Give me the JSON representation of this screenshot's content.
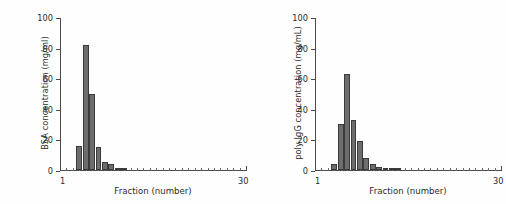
{
  "figure": {
    "background": "#ffffff",
    "bar_color": "#6d6d6d",
    "bar_edge_color": "#3a3a3a",
    "axis_color": "#4a4a4a",
    "text_color": "#2b2b2b"
  },
  "chart_data": [
    {
      "type": "bar",
      "panel": "left",
      "title": "",
      "xlabel": "Fraction (number)",
      "ylabel": "BSA concentration (mg/ml)",
      "xlim": [
        1,
        30
      ],
      "ylim": [
        0,
        100
      ],
      "yticks": [
        0,
        20,
        40,
        60,
        80,
        100
      ],
      "ytick_labels": [
        "0",
        "20",
        "40",
        "60",
        "80",
        "100"
      ],
      "xtick_labels": [
        "1",
        "30"
      ],
      "xtick_label_positions": [
        1,
        30
      ],
      "grid": false,
      "legend": null,
      "categories": [
        1,
        2,
        3,
        4,
        5,
        6,
        7,
        8,
        9,
        10,
        11,
        12,
        13,
        14,
        15,
        16,
        17,
        18,
        19,
        20,
        21,
        22,
        23,
        24,
        25,
        26,
        27,
        28,
        29,
        30
      ],
      "values": [
        0,
        0,
        0,
        16,
        82,
        50,
        15,
        5,
        4,
        1,
        0.5,
        0,
        0,
        0,
        0,
        0,
        0,
        0,
        0,
        0,
        0,
        0,
        0,
        0,
        0,
        0,
        0,
        0,
        0,
        0
      ]
    },
    {
      "type": "bar",
      "panel": "right",
      "title": "",
      "xlabel": "Fraction (number)",
      "ylabel": "poly IgG concentration (mg/mL)",
      "xlim": [
        1,
        30
      ],
      "ylim": [
        0,
        100
      ],
      "yticks": [
        0,
        20,
        40,
        60,
        80,
        100
      ],
      "ytick_labels": [
        "0",
        "20",
        "40",
        "60",
        "80",
        "100"
      ],
      "xtick_labels": [
        "1",
        "30"
      ],
      "xtick_label_positions": [
        1,
        30
      ],
      "grid": false,
      "legend": null,
      "categories": [
        1,
        2,
        3,
        4,
        5,
        6,
        7,
        8,
        9,
        10,
        11,
        12,
        13,
        14,
        15,
        16,
        17,
        18,
        19,
        20,
        21,
        22,
        23,
        24,
        25,
        26,
        27,
        28,
        29,
        30
      ],
      "values": [
        0,
        0,
        0,
        4,
        30,
        63,
        33,
        19,
        8,
        4,
        2,
        1,
        1,
        0.5,
        0,
        0,
        0,
        0,
        0,
        0,
        0,
        0,
        0,
        0,
        0,
        0,
        0,
        0,
        0,
        0
      ]
    }
  ]
}
